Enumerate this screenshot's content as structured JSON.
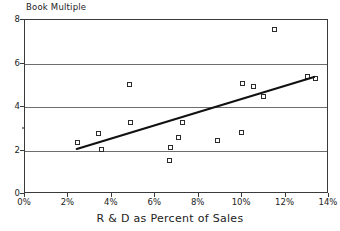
{
  "chart_data": {
    "type": "scatter",
    "title": "Book Multiple",
    "xlabel": "R & D as Percent of Sales",
    "ylabel": "Book Multiple",
    "xlim": [
      0,
      14
    ],
    "ylim": [
      0,
      8
    ],
    "grid": true,
    "legend": "none",
    "x_tick_labels": [
      "0%",
      "2%",
      "4%",
      "6%",
      "8%",
      "10%",
      "12%",
      "14%"
    ],
    "x_ticks": [
      0,
      2,
      4,
      6,
      8,
      10,
      12,
      14
    ],
    "y_tick_labels": [
      "0",
      "2",
      "4",
      "6",
      "8"
    ],
    "y_ticks": [
      0,
      2,
      4,
      6,
      8
    ],
    "gridlines_y": [
      2,
      4,
      6
    ],
    "points": [
      {
        "x": 2.4,
        "y": 2.35
      },
      {
        "x": 3.4,
        "y": 2.8
      },
      {
        "x": 3.5,
        "y": 2.05
      },
      {
        "x": 4.8,
        "y": 5.05
      },
      {
        "x": 4.85,
        "y": 3.28
      },
      {
        "x": 6.65,
        "y": 1.52
      },
      {
        "x": 6.7,
        "y": 2.15
      },
      {
        "x": 7.05,
        "y": 2.6
      },
      {
        "x": 7.25,
        "y": 3.3
      },
      {
        "x": 8.85,
        "y": 2.45
      },
      {
        "x": 9.95,
        "y": 2.85
      },
      {
        "x": 10.0,
        "y": 5.08
      },
      {
        "x": 10.5,
        "y": 4.95
      },
      {
        "x": 11.0,
        "y": 4.5
      },
      {
        "x": 11.5,
        "y": 7.55
      },
      {
        "x": 13.0,
        "y": 5.42
      },
      {
        "x": 13.4,
        "y": 5.32
      }
    ],
    "trendline": {
      "label": "linear fit",
      "x_start": 2.4,
      "y_start": 2.0,
      "x_end": 13.4,
      "y_end": 5.35
    },
    "series": [
      {
        "name": "Book Multiple",
        "marker": "open-square",
        "color": "#2b2b2b"
      }
    ]
  },
  "colors": {
    "axis": "#3a3a3a",
    "grid": "#6d6d6d",
    "marker": "#2b2b2b",
    "trendline": "#111111",
    "background": "#ffffff"
  }
}
